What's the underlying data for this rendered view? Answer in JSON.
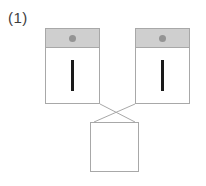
{
  "figure": {
    "label": "(1)",
    "type": "block-diagram",
    "background_color": "#ffffff",
    "width": 206,
    "height": 186
  },
  "palette": {
    "outline": "#a8a8a8",
    "header_fill": "#cfcfcf",
    "dot_fill": "#949494",
    "bar_fill": "#1a1a1a",
    "box_fill": "#ffffff",
    "connector_stroke": "#a8a8a8",
    "label_color": "#3d3d3d"
  },
  "nodes": {
    "top_left": {
      "name": "left-unit",
      "header_icon": "dot-icon",
      "body_icon": "vertical-bar-icon",
      "x": 45,
      "y": 28,
      "w": 55,
      "h": 76
    },
    "top_right": {
      "name": "right-unit",
      "header_icon": "dot-icon",
      "body_icon": "vertical-bar-icon",
      "x": 135,
      "y": 28,
      "w": 55,
      "h": 76
    },
    "bottom": {
      "name": "bottom-unit",
      "x": 90,
      "y": 122,
      "w": 49,
      "h": 50
    }
  },
  "connectors": [
    {
      "name": "left-to-bottom",
      "from": "top_left",
      "to": "bottom",
      "points": "100,104 135,122"
    },
    {
      "name": "right-to-bottom",
      "from": "top_right",
      "to": "bottom",
      "points": "135,104 94,122"
    }
  ]
}
